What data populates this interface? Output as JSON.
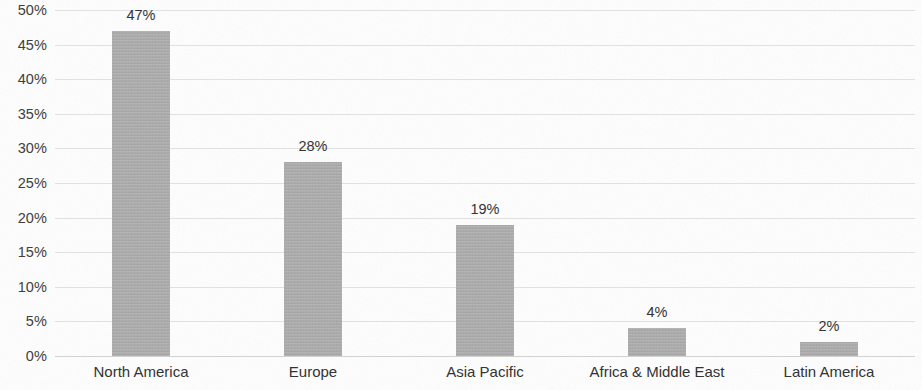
{
  "chart_data": {
    "type": "bar",
    "title": "",
    "subtitle": "",
    "xlabel": "",
    "ylabel": "",
    "categories": [
      "North America",
      "Europe",
      "Asia Pacific",
      "Africa & Middle East",
      "Latin America"
    ],
    "values": [
      47,
      28,
      19,
      4,
      2
    ],
    "value_labels": [
      "47%",
      "28%",
      "19%",
      "4%",
      "2%"
    ],
    "ylim": [
      0,
      50
    ],
    "ytick_values": [
      50,
      45,
      40,
      35,
      30,
      25,
      20,
      15,
      10,
      5,
      0
    ],
    "ytick_labels": [
      "50%",
      "45%",
      "40%",
      "35%",
      "30%",
      "25%",
      "20%",
      "15%",
      "10%",
      "5%",
      "0%"
    ],
    "grid": true,
    "grid_axis": "y",
    "legend": false,
    "legend_position": "none",
    "bar_color": "#a9a9a9",
    "gridline_color": "#e2e2e2",
    "text_color": "#2e2e2e",
    "background_color": "#ffffff",
    "data_labels_shown": true
  }
}
